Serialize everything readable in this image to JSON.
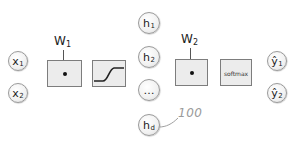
{
  "diagram": {
    "inputs": [
      {
        "symbol": "x",
        "sub": "1"
      },
      {
        "symbol": "x",
        "sub": "2"
      }
    ],
    "layer1": {
      "weight_label": {
        "symbol": "W",
        "sub": "1"
      },
      "op_icon": "dot-product-icon",
      "activation_icon": "sigmoid-curve-icon"
    },
    "hidden": [
      {
        "symbol": "h",
        "sub": "1"
      },
      {
        "symbol": "h",
        "sub": "2"
      },
      {
        "symbol": "…",
        "sub": ""
      },
      {
        "symbol": "h",
        "sub": "d"
      }
    ],
    "hidden_annotation": "100",
    "layer2": {
      "weight_label": {
        "symbol": "W",
        "sub": "2"
      },
      "op_icon": "dot-product-icon",
      "activation_label": "softmax"
    },
    "outputs": [
      {
        "symbol": "ŷ",
        "sub": "1"
      },
      {
        "symbol": "ŷ",
        "sub": "2"
      }
    ],
    "colors": {
      "node_border": "#9a9a9a",
      "box_fill": "#ececec",
      "box_border": "#7d7d7d",
      "annotation": "#9a9a9a"
    }
  }
}
